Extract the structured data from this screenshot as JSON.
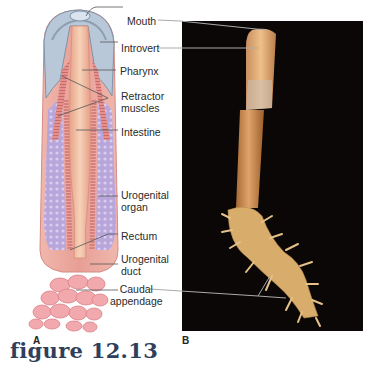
{
  "figure": {
    "caption": "figure 12.13",
    "panels": [
      {
        "letter": "A",
        "type": "illustration",
        "subject": "internal anatomy diagram"
      },
      {
        "letter": "B",
        "type": "photograph",
        "subject": "whole animal on black background"
      }
    ],
    "labels": [
      {
        "id": "mouth",
        "text": "Mouth"
      },
      {
        "id": "introvert",
        "text": "Introvert"
      },
      {
        "id": "pharynx",
        "text": "Pharynx"
      },
      {
        "id": "retractor",
        "text": "Retractor\nmuscles"
      },
      {
        "id": "intestine",
        "text": "Intestine"
      },
      {
        "id": "urogenital_organ",
        "text": "Urogenital\norgan"
      },
      {
        "id": "rectum",
        "text": "Rectum"
      },
      {
        "id": "urogenital_duct",
        "text": "Urogenital\nduct"
      },
      {
        "id": "caudal",
        "text": "Caudal\nappendage"
      }
    ],
    "colors": {
      "caption": "#2f3f5c",
      "photo_bg": "#0a0706",
      "body_pink": "#e9a59c",
      "organ_purple": "#b7a6d8",
      "introvert_blue": "#b9c8d8",
      "animal_tan": "#d39a5c"
    }
  }
}
